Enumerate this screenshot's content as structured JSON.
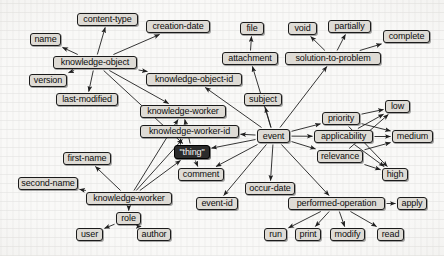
{
  "diagram": {
    "type": "directed-concept-graph",
    "canvas": {
      "width": 444,
      "height": 256
    },
    "style": {
      "background_color": "#f2f1ee",
      "node_fill": "#dedbd5",
      "node_border": "#1b1b1b",
      "node_text": "#0d0d0d",
      "highlight_fill": "#2b2b2b",
      "highlight_text": "#f4f4f4",
      "edge_color": "#1f1f1f"
    },
    "root_node": "thing",
    "nodes": [
      {
        "id": "name",
        "label": "name",
        "x": 30,
        "y": 33,
        "w": 31,
        "h": 13,
        "highlight": false
      },
      {
        "id": "content-type",
        "label": "content-type",
        "x": 77,
        "y": 13,
        "w": 61,
        "h": 13,
        "highlight": false
      },
      {
        "id": "creation-date",
        "label": "creation-date",
        "x": 146,
        "y": 20,
        "w": 64,
        "h": 13,
        "highlight": false
      },
      {
        "id": "knowledge-object",
        "label": "knowledge-object",
        "x": 53,
        "y": 56,
        "w": 84,
        "h": 13,
        "highlight": false
      },
      {
        "id": "version",
        "label": "version",
        "x": 29,
        "y": 74,
        "w": 38,
        "h": 13,
        "highlight": false
      },
      {
        "id": "last-modified",
        "label": "last-modified",
        "x": 56,
        "y": 93,
        "w": 62,
        "h": 13,
        "highlight": false
      },
      {
        "id": "knowledge-object-id",
        "label": "knowledge-object-id",
        "x": 146,
        "y": 73,
        "w": 96,
        "h": 13,
        "highlight": false
      },
      {
        "id": "file",
        "label": "file",
        "x": 240,
        "y": 22,
        "w": 24,
        "h": 13,
        "highlight": false
      },
      {
        "id": "attachment",
        "label": "attachment",
        "x": 222,
        "y": 52,
        "w": 56,
        "h": 13,
        "highlight": false
      },
      {
        "id": "void",
        "label": "void",
        "x": 288,
        "y": 22,
        "w": 29,
        "h": 13,
        "highlight": false
      },
      {
        "id": "partially",
        "label": "partially",
        "x": 328,
        "y": 20,
        "w": 43,
        "h": 13,
        "highlight": false
      },
      {
        "id": "complete",
        "label": "complete",
        "x": 383,
        "y": 30,
        "w": 47,
        "h": 13,
        "highlight": false
      },
      {
        "id": "solution-to-problem",
        "label": "solution-to-problem",
        "x": 285,
        "y": 52,
        "w": 96,
        "h": 13,
        "highlight": false
      },
      {
        "id": "subject",
        "label": "subject",
        "x": 244,
        "y": 93,
        "w": 38,
        "h": 13,
        "highlight": false
      },
      {
        "id": "knowledge-worker-id",
        "label": "knowledge-worker-id",
        "x": 140,
        "y": 125,
        "w": 99,
        "h": 13,
        "highlight": false
      },
      {
        "id": "event",
        "label": "event",
        "x": 257,
        "y": 129,
        "w": 33,
        "h": 14,
        "highlight": false
      },
      {
        "id": "priority",
        "label": "priority",
        "x": 322,
        "y": 112,
        "w": 38,
        "h": 13,
        "highlight": false
      },
      {
        "id": "applicability",
        "label": "applicability",
        "x": 314,
        "y": 130,
        "w": 59,
        "h": 13,
        "highlight": false
      },
      {
        "id": "relevance",
        "label": "relevance",
        "x": 317,
        "y": 150,
        "w": 46,
        "h": 13,
        "highlight": false
      },
      {
        "id": "low",
        "label": "low",
        "x": 385,
        "y": 100,
        "w": 25,
        "h": 13,
        "highlight": false
      },
      {
        "id": "medium",
        "label": "medium",
        "x": 392,
        "y": 130,
        "w": 41,
        "h": 13,
        "highlight": false
      },
      {
        "id": "high",
        "label": "high",
        "x": 382,
        "y": 168,
        "w": 26,
        "h": 13,
        "highlight": false
      },
      {
        "id": "thing",
        "label": "\"thing\"",
        "x": 174,
        "y": 145,
        "w": 36,
        "h": 14,
        "highlight": true
      },
      {
        "id": "comment",
        "label": "comment",
        "x": 178,
        "y": 168,
        "w": 46,
        "h": 13,
        "highlight": false
      },
      {
        "id": "first-name",
        "label": "first-name",
        "x": 63,
        "y": 152,
        "w": 48,
        "h": 13,
        "highlight": false
      },
      {
        "id": "second-name",
        "label": "second-name",
        "x": 18,
        "y": 177,
        "w": 60,
        "h": 13,
        "highlight": false
      },
      {
        "id": "knowledge-worker",
        "label": "knowledge-worker",
        "x": 86,
        "y": 192,
        "w": 86,
        "h": 13,
        "highlight": false
      },
      {
        "id": "knowledge-worker-top",
        "label": "knowledge-worker",
        "x": 140,
        "y": 105,
        "w": 86,
        "h": 13,
        "highlight": false
      },
      {
        "id": "occur-date",
        "label": "occur-date",
        "x": 245,
        "y": 182,
        "w": 50,
        "h": 13,
        "highlight": false
      },
      {
        "id": "event-id",
        "label": "event-id",
        "x": 196,
        "y": 197,
        "w": 42,
        "h": 13,
        "highlight": false
      },
      {
        "id": "performed-operation",
        "label": "performed-operation",
        "x": 288,
        "y": 197,
        "w": 97,
        "h": 13,
        "highlight": false
      },
      {
        "id": "apply",
        "label": "apply",
        "x": 397,
        "y": 197,
        "w": 30,
        "h": 13,
        "highlight": false
      },
      {
        "id": "role",
        "label": "role",
        "x": 116,
        "y": 212,
        "w": 25,
        "h": 13,
        "highlight": false
      },
      {
        "id": "user",
        "label": "user",
        "x": 76,
        "y": 228,
        "w": 27,
        "h": 13,
        "highlight": false
      },
      {
        "id": "author",
        "label": "author",
        "x": 137,
        "y": 228,
        "w": 34,
        "h": 13,
        "highlight": false
      },
      {
        "id": "run",
        "label": "run",
        "x": 264,
        "y": 228,
        "w": 23,
        "h": 13,
        "highlight": false
      },
      {
        "id": "print",
        "label": "print",
        "x": 295,
        "y": 228,
        "w": 26,
        "h": 13,
        "highlight": false
      },
      {
        "id": "modify",
        "label": "modify",
        "x": 330,
        "y": 228,
        "w": 35,
        "h": 13,
        "highlight": false
      },
      {
        "id": "read",
        "label": "read",
        "x": 377,
        "y": 228,
        "w": 27,
        "h": 13,
        "highlight": false
      }
    ],
    "edges": [
      {
        "from": "knowledge-object",
        "to": "name"
      },
      {
        "from": "knowledge-object",
        "to": "content-type"
      },
      {
        "from": "knowledge-object",
        "to": "creation-date"
      },
      {
        "from": "knowledge-object",
        "to": "version"
      },
      {
        "from": "knowledge-object",
        "to": "last-modified"
      },
      {
        "from": "knowledge-object",
        "to": "knowledge-object-id"
      },
      {
        "from": "knowledge-object",
        "to": "knowledge-worker-top"
      },
      {
        "from": "knowledge-object",
        "to": "thing"
      },
      {
        "from": "attachment",
        "to": "file"
      },
      {
        "from": "solution-to-problem",
        "to": "void"
      },
      {
        "from": "solution-to-problem",
        "to": "partially"
      },
      {
        "from": "solution-to-problem",
        "to": "complete"
      },
      {
        "from": "event",
        "to": "attachment"
      },
      {
        "from": "event",
        "to": "solution-to-problem"
      },
      {
        "from": "event",
        "to": "subject"
      },
      {
        "from": "event",
        "to": "knowledge-object-id"
      },
      {
        "from": "event",
        "to": "knowledge-worker-id"
      },
      {
        "from": "event",
        "to": "priority"
      },
      {
        "from": "event",
        "to": "applicability"
      },
      {
        "from": "event",
        "to": "relevance"
      },
      {
        "from": "event",
        "to": "occur-date"
      },
      {
        "from": "event",
        "to": "event-id"
      },
      {
        "from": "event",
        "to": "performed-operation"
      },
      {
        "from": "event",
        "to": "comment"
      },
      {
        "from": "event",
        "to": "thing"
      },
      {
        "from": "priority",
        "to": "low"
      },
      {
        "from": "priority",
        "to": "medium"
      },
      {
        "from": "priority",
        "to": "high"
      },
      {
        "from": "applicability",
        "to": "low"
      },
      {
        "from": "applicability",
        "to": "medium"
      },
      {
        "from": "applicability",
        "to": "high"
      },
      {
        "from": "relevance",
        "to": "low"
      },
      {
        "from": "relevance",
        "to": "medium"
      },
      {
        "from": "relevance",
        "to": "high"
      },
      {
        "from": "thing",
        "to": "knowledge-worker-top"
      },
      {
        "from": "thing",
        "to": "comment"
      },
      {
        "from": "knowledge-worker",
        "to": "first-name"
      },
      {
        "from": "knowledge-worker",
        "to": "second-name"
      },
      {
        "from": "knowledge-worker",
        "to": "knowledge-worker-id"
      },
      {
        "from": "knowledge-worker",
        "to": "knowledge-worker-top"
      },
      {
        "from": "knowledge-worker",
        "to": "role"
      },
      {
        "from": "knowledge-worker",
        "to": "thing"
      },
      {
        "from": "role",
        "to": "user"
      },
      {
        "from": "role",
        "to": "author"
      },
      {
        "from": "performed-operation",
        "to": "apply"
      },
      {
        "from": "performed-operation",
        "to": "run"
      },
      {
        "from": "performed-operation",
        "to": "print"
      },
      {
        "from": "performed-operation",
        "to": "modify"
      },
      {
        "from": "performed-operation",
        "to": "read"
      }
    ]
  }
}
